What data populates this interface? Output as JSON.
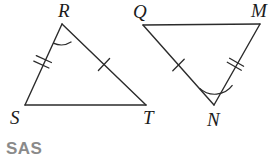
{
  "figure": {
    "kind": "geometry-diagram",
    "background_color": "#ffffff",
    "stroke_color": "#2b2b2b",
    "stroke_width": 1.4,
    "triangles": [
      {
        "name": "triangle-rst",
        "vertices": [
          {
            "label": "R",
            "x": 62,
            "y": 24,
            "label_x": 58,
            "label_y": 17
          },
          {
            "label": "S",
            "x": 25,
            "y": 105,
            "label_x": 10,
            "label_y": 124
          },
          {
            "label": "T",
            "x": 146,
            "y": 105,
            "label_x": 143,
            "label_y": 124
          }
        ],
        "sides": [
          {
            "name": "side-sr",
            "from": "S",
            "to": "R",
            "ticks": 2
          },
          {
            "name": "side-rt",
            "from": "R",
            "to": "T",
            "ticks": 1
          },
          {
            "name": "side-st",
            "from": "S",
            "to": "T",
            "ticks": 0
          }
        ],
        "angle_arcs": [
          {
            "name": "angle-arc-r",
            "at": "R",
            "radius": 19
          }
        ]
      },
      {
        "name": "triangle-qmn",
        "vertices": [
          {
            "label": "Q",
            "x": 143,
            "y": 25,
            "label_x": 133,
            "label_y": 18
          },
          {
            "label": "M",
            "x": 260,
            "y": 24,
            "label_x": 251,
            "label_y": 17
          },
          {
            "label": "N",
            "x": 214,
            "y": 105,
            "label_x": 207,
            "label_y": 126
          }
        ],
        "sides": [
          {
            "name": "side-qn",
            "from": "Q",
            "to": "N",
            "ticks": 1
          },
          {
            "name": "side-mn",
            "from": "M",
            "to": "N",
            "ticks": 2
          },
          {
            "name": "side-qm",
            "from": "Q",
            "to": "M",
            "ticks": 0
          }
        ],
        "angle_arcs": [
          {
            "name": "angle-arc-n",
            "at": "N",
            "radius": 22
          }
        ]
      }
    ]
  },
  "answer": {
    "text": "SAS",
    "color": "#8a8a8a"
  }
}
